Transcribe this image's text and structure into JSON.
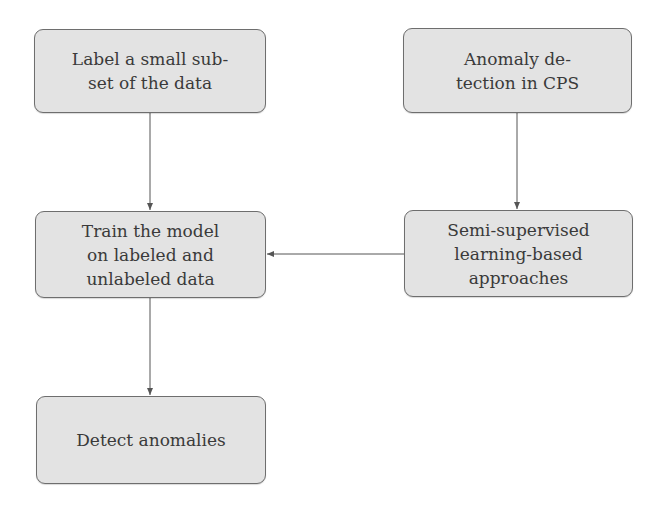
{
  "diagram": {
    "type": "flowchart",
    "nodes": [
      {
        "id": "label-subset",
        "text": "Label a small sub-\nset of the data"
      },
      {
        "id": "anomaly-detection-cps",
        "text": "Anomaly de-\ntection in CPS"
      },
      {
        "id": "train-model",
        "text": "Train the model\non labeled and\nunlabeled data"
      },
      {
        "id": "semi-supervised",
        "text": "Semi-supervised\nlearning-based\napproaches"
      },
      {
        "id": "detect-anomalies",
        "text": "Detect anomalies"
      }
    ],
    "edges": [
      {
        "from": "label-subset",
        "to": "train-model"
      },
      {
        "from": "anomaly-detection-cps",
        "to": "semi-supervised"
      },
      {
        "from": "semi-supervised",
        "to": "train-model"
      },
      {
        "from": "train-model",
        "to": "detect-anomalies"
      }
    ],
    "colors": {
      "node_fill": "#e3e3e3",
      "node_border": "#6e6e6e",
      "edge": "#555555",
      "text": "#3a3a3a"
    }
  }
}
